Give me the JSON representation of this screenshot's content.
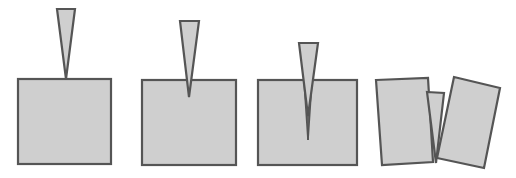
{
  "figure": {
    "colors": {
      "fill": "#cfcfcf",
      "stroke": "#555555",
      "background": "#ffffff"
    },
    "stages": [
      {
        "index": 1,
        "state": "wedge-touching-block",
        "block": {
          "x": 18,
          "y": 79,
          "width": 93,
          "height": 85
        },
        "wedge": {
          "top_left": [
            57,
            9
          ],
          "top_right": [
            75,
            9
          ],
          "tip": [
            66,
            79
          ]
        }
      },
      {
        "index": 2,
        "state": "wedge-penetrating-block",
        "block": {
          "x": 142,
          "y": 80,
          "width": 94,
          "height": 85
        },
        "wedge": {
          "top_left": [
            180,
            21
          ],
          "top_right": [
            199,
            21
          ],
          "tip": [
            189,
            97
          ]
        }
      },
      {
        "index": 3,
        "state": "crack-propagating",
        "block": {
          "x": 258,
          "y": 80,
          "width": 99,
          "height": 85
        },
        "wedge": {
          "top_left": [
            299,
            43
          ],
          "top_right": [
            318,
            43
          ],
          "tip": [
            308,
            116
          ]
        },
        "crack_end": [
          308,
          140
        ]
      },
      {
        "index": 4,
        "state": "block-split",
        "left_piece": [
          [
            376,
            80
          ],
          [
            428,
            78
          ],
          [
            433,
            162
          ],
          [
            382,
            165
          ]
        ],
        "wedge": [
          [
            427,
            92
          ],
          [
            444,
            93
          ],
          [
            436,
            163
          ]
        ],
        "right_piece": [
          [
            454,
            77
          ],
          [
            500,
            88
          ],
          [
            484,
            168
          ],
          [
            437,
            158
          ]
        ]
      }
    ]
  }
}
